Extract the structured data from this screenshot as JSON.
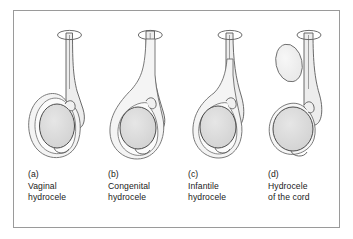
{
  "figure": {
    "border_color": "#9a9a9a",
    "background_color": "#ffffff"
  },
  "colors": {
    "outline": "#5a5a5a",
    "testis_fill": "#d9d9d9",
    "testis_outline": "#4a4a4a",
    "sac_fill": "#f2f2f2",
    "cord_fill": "#ededed",
    "text": "#1a1a1a"
  },
  "panels": [
    {
      "tag": "(a)",
      "name_line1": "Vaginal",
      "name_line2": "hydrocele",
      "icon": "vaginal-hydrocele-diagram",
      "description": "Hydrocele sac confined around the testis; cord is a narrow closed tube"
    },
    {
      "tag": "(b)",
      "name_line1": "Congenital",
      "name_line2": "hydrocele",
      "icon": "congenital-hydrocele-diagram",
      "description": "Hydrocele sac continuous with the peritoneal cavity along the whole cord"
    },
    {
      "tag": "(c)",
      "name_line1": "Infantile",
      "name_line2": "hydrocele",
      "icon": "infantile-hydrocele-diagram",
      "description": "Hydrocele sac extends part-way up the cord but does not reach the peritoneum"
    },
    {
      "tag": "(d)",
      "name_line1": "Hydrocele",
      "name_line2": "of the cord",
      "icon": "hydrocele-of-the-cord-diagram",
      "description": "Isolated cyst of the cord separate from the testis"
    }
  ]
}
